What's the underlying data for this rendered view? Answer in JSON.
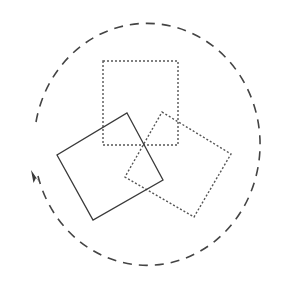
{
  "diagram": {
    "colors": {
      "stroke": "#3a3a3a",
      "dotted": "#555555",
      "path": "#444444",
      "background": "#ffffff"
    },
    "elements": [
      {
        "id": "original-rect",
        "style": "dotted",
        "label": "Original position (upright)"
      },
      {
        "id": "rotated-rect-solid",
        "style": "solid",
        "label": "Rotated position"
      },
      {
        "id": "rotated-rect-dotted",
        "style": "dotted",
        "label": "Rotated position (alternate)"
      },
      {
        "id": "rotation-path",
        "style": "dashed",
        "label": "Rotation path"
      }
    ],
    "rotation_direction": "counter-clockwise"
  }
}
